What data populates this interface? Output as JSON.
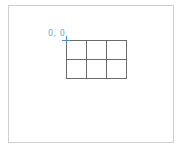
{
  "canvas": {
    "origin_label": "0, 0",
    "grid": {
      "columns": 3,
      "rows": 2
    },
    "colors": {
      "frame_border": "#cfcfcf",
      "grid_line": "#6a6a6a",
      "origin_label": "#6fa8d6",
      "origin_marker": "#4a8cc9"
    }
  }
}
